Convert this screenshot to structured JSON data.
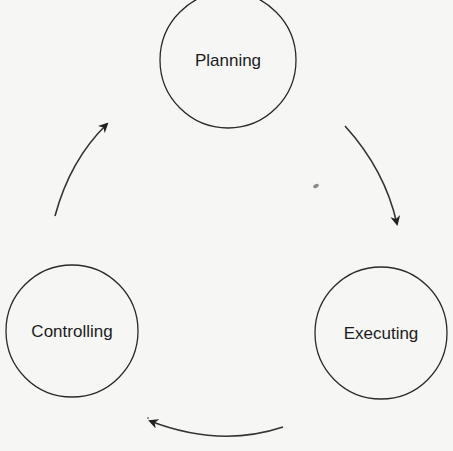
{
  "diagram": {
    "type": "cycle",
    "nodes": [
      {
        "id": "planning",
        "label": "Planning",
        "cx": 228,
        "cy": 60,
        "r": 68
      },
      {
        "id": "executing",
        "label": "Executing",
        "cx": 381,
        "cy": 333,
        "r": 66
      },
      {
        "id": "controlling",
        "label": "Controlling",
        "cx": 72,
        "cy": 331,
        "r": 66
      }
    ],
    "edges": [
      {
        "from": "planning",
        "to": "executing"
      },
      {
        "from": "executing",
        "to": "controlling"
      },
      {
        "from": "controlling",
        "to": "planning"
      }
    ],
    "colors": {
      "background": "#f6f6f5",
      "stroke": "#2a2a2a",
      "text": "#1c1c1c"
    }
  }
}
